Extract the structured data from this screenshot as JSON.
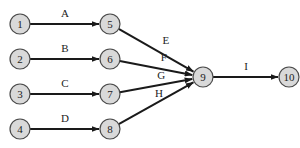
{
  "diagram": {
    "type": "network",
    "nodes": [
      {
        "id": "1",
        "label": "1",
        "x": 20,
        "y": 24
      },
      {
        "id": "2",
        "label": "2",
        "x": 20,
        "y": 59
      },
      {
        "id": "3",
        "label": "3",
        "x": 20,
        "y": 94
      },
      {
        "id": "4",
        "label": "4",
        "x": 20,
        "y": 129
      },
      {
        "id": "5",
        "label": "5",
        "x": 110,
        "y": 24
      },
      {
        "id": "6",
        "label": "6",
        "x": 110,
        "y": 59
      },
      {
        "id": "7",
        "label": "7",
        "x": 110,
        "y": 94
      },
      {
        "id": "8",
        "label": "8",
        "x": 110,
        "y": 129
      },
      {
        "id": "9",
        "label": "9",
        "x": 203,
        "y": 77
      },
      {
        "id": "10",
        "label": "10",
        "x": 289,
        "y": 77
      }
    ],
    "edges": [
      {
        "from": "1",
        "to": "5",
        "label": "A"
      },
      {
        "from": "2",
        "to": "6",
        "label": "B"
      },
      {
        "from": "3",
        "to": "7",
        "label": "C"
      },
      {
        "from": "4",
        "to": "8",
        "label": "D"
      },
      {
        "from": "5",
        "to": "9",
        "label": "E"
      },
      {
        "from": "6",
        "to": "9",
        "label": "F"
      },
      {
        "from": "7",
        "to": "9",
        "label": "G"
      },
      {
        "from": "8",
        "to": "9",
        "label": "H"
      },
      {
        "from": "9",
        "to": "10",
        "label": "I"
      }
    ]
  }
}
